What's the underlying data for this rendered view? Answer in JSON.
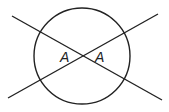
{
  "diagram": {
    "labels": {
      "left_angle": "A",
      "right_angle": "A"
    },
    "circle": {
      "cx": 82,
      "cy": 56,
      "r": 48
    },
    "lines": [
      {
        "x1": 12,
        "y1": 16,
        "x2": 162,
        "y2": 100
      },
      {
        "x1": 8,
        "y1": 98,
        "x2": 158,
        "y2": 14
      }
    ],
    "stroke_color": "#222222"
  }
}
